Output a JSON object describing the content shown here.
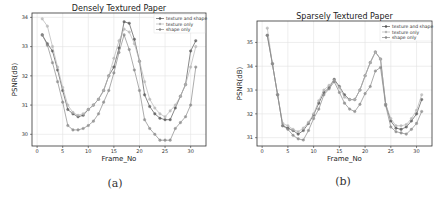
{
  "chart_data": [
    {
      "type": "line",
      "title": "Densely Textured Paper",
      "caption": "(a)",
      "xlabel": "Frame_No",
      "ylabel": "PSNR(dB)",
      "xlim": [
        -1,
        33
      ],
      "ylim": [
        29.6,
        34.15
      ],
      "xticks": [
        0,
        5,
        10,
        15,
        20,
        25,
        30
      ],
      "yticks": [
        30,
        31,
        32,
        33,
        34
      ],
      "grid": true,
      "legend_position": "upper right",
      "x": [
        1,
        2,
        3,
        4,
        5,
        6,
        7,
        8,
        9,
        10,
        11,
        12,
        13,
        14,
        15,
        16,
        17,
        18,
        19,
        20,
        21,
        22,
        23,
        24,
        25,
        26,
        27,
        28,
        29,
        30,
        31
      ],
      "series": [
        {
          "name": "texture and shape",
          "color": "#555555",
          "values": [
            33.4,
            33.1,
            32.85,
            32.2,
            31.5,
            30.85,
            30.7,
            30.6,
            30.65,
            30.85,
            31.0,
            31.2,
            31.5,
            32.0,
            32.3,
            32.95,
            33.85,
            33.8,
            33.25,
            32.5,
            31.35,
            30.95,
            30.7,
            30.55,
            30.5,
            30.5,
            30.9,
            31.3,
            31.7,
            32.85,
            33.2
          ]
        },
        {
          "name": "texture only",
          "color": "#b5b5b5",
          "values": [
            33.95,
            33.7,
            33.0,
            32.3,
            31.6,
            31.0,
            30.75,
            30.65,
            30.7,
            30.85,
            31.0,
            31.2,
            31.5,
            32.0,
            32.6,
            33.2,
            33.6,
            33.5,
            33.1,
            32.5,
            31.8,
            31.2,
            30.9,
            30.7,
            30.6,
            30.8,
            31.0,
            31.3,
            31.7,
            32.3,
            33.0
          ]
        },
        {
          "name": "shape only",
          "color": "#888888",
          "values": [
            33.4,
            33.05,
            32.45,
            31.8,
            31.1,
            30.3,
            30.15,
            30.15,
            30.2,
            30.3,
            30.45,
            30.7,
            31.1,
            31.5,
            32.1,
            32.8,
            33.4,
            32.9,
            32.2,
            31.5,
            30.5,
            30.2,
            30.0,
            29.8,
            29.8,
            29.8,
            30.2,
            30.4,
            30.6,
            31.0,
            32.3
          ]
        }
      ]
    },
    {
      "type": "line",
      "title": "Sparsely Textured Paper",
      "caption": "(b)",
      "xlabel": "Frame_No",
      "ylabel": "PSNR(dB)",
      "xlim": [
        -1,
        33
      ],
      "ylim": [
        30.65,
        35.9
      ],
      "xticks": [
        0,
        5,
        10,
        15,
        20,
        25,
        30
      ],
      "yticks": [
        31,
        32,
        33,
        34,
        35
      ],
      "grid": true,
      "legend_position": "upper right",
      "x": [
        1,
        2,
        3,
        4,
        5,
        6,
        7,
        8,
        9,
        10,
        11,
        12,
        13,
        14,
        15,
        16,
        17,
        18,
        19,
        20,
        21,
        22,
        23,
        24,
        25,
        26,
        27,
        28,
        29,
        30,
        31
      ],
      "series": [
        {
          "name": "texture and shape",
          "color": "#555555",
          "values": [
            35.3,
            34.1,
            32.8,
            31.5,
            31.4,
            31.3,
            31.15,
            31.3,
            31.6,
            31.95,
            32.45,
            32.9,
            33.1,
            33.45,
            33.15,
            32.8,
            32.6,
            32.6,
            33.0,
            33.6,
            34.15,
            34.6,
            34.3,
            32.4,
            31.7,
            31.4,
            31.35,
            31.45,
            31.7,
            32.0,
            32.6
          ]
        },
        {
          "name": "texture only",
          "color": "#b5b5b5",
          "values": [
            35.6,
            34.1,
            32.8,
            31.6,
            31.5,
            31.35,
            31.25,
            31.4,
            31.65,
            32.0,
            32.55,
            33.0,
            33.2,
            33.4,
            33.1,
            32.7,
            32.6,
            32.6,
            33.0,
            33.6,
            34.15,
            34.6,
            34.3,
            32.4,
            31.8,
            31.5,
            31.5,
            31.55,
            31.8,
            32.15,
            32.8
          ]
        },
        {
          "name": "shape only",
          "color": "#888888",
          "values": [
            35.3,
            34.1,
            32.8,
            31.5,
            31.35,
            31.1,
            30.95,
            30.9,
            31.3,
            31.8,
            32.2,
            32.8,
            33.05,
            33.35,
            32.9,
            32.45,
            32.2,
            32.1,
            32.4,
            32.85,
            33.15,
            33.8,
            33.95,
            32.35,
            31.45,
            31.25,
            31.2,
            31.15,
            31.35,
            31.6,
            32.1
          ]
        }
      ]
    }
  ]
}
